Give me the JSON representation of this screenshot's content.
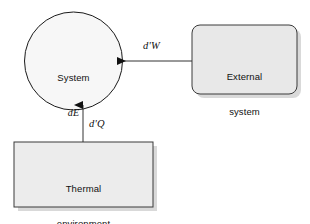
{
  "diagram": {
    "background_color": "#ffffff",
    "stroke_color": "#1a1a1a",
    "nodes": {
      "system": {
        "shape": "circle",
        "label_line1": "System",
        "label_line2": "dE",
        "fill_color": "#f7f7f7"
      },
      "external_system": {
        "shape": "rounded-rectangle",
        "label_line1": "External",
        "label_line2": "system",
        "fill_color": "#e8e8e8"
      },
      "thermal_environment": {
        "shape": "rectangle",
        "label_line1": "Thermal",
        "label_line2": "environment",
        "fill_color": "#ececec"
      }
    },
    "flows": [
      {
        "name": "work",
        "label": "d'W",
        "from": "external_system",
        "to": "system",
        "direction": "left"
      },
      {
        "name": "heat",
        "label": "d'Q",
        "from": "thermal_environment",
        "to": "system",
        "direction": "up"
      }
    ]
  }
}
